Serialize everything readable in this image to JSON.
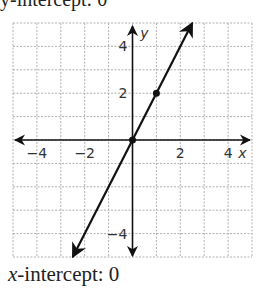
{
  "top_caption": "y-intercept: 0",
  "caption": {
    "variable": "x",
    "text": "-intercept: 0"
  },
  "chart_data": {
    "type": "line",
    "title": "",
    "xlabel": "x",
    "ylabel": "y",
    "xlim": [
      -5,
      5
    ],
    "ylim": [
      -5,
      5
    ],
    "grid": true,
    "x_ticks": [
      -4,
      -2,
      2,
      4
    ],
    "y_ticks": [
      4,
      2,
      -4
    ],
    "x_tick_labels": [
      "−4",
      "−2",
      "2",
      "4"
    ],
    "y_tick_labels": [
      "4",
      "2",
      "−4"
    ],
    "series": [
      {
        "name": "y = 2x",
        "equation": "y = 2x",
        "points": [
          {
            "x": 0,
            "y": 0
          },
          {
            "x": 1,
            "y": 2
          }
        ],
        "extends": [
          {
            "x": -2.5,
            "y": -5
          },
          {
            "x": 2.5,
            "y": 5
          }
        ],
        "arrows": "both"
      }
    ],
    "colors": {
      "line": "#111111",
      "grid": "#b0b0b0"
    }
  }
}
